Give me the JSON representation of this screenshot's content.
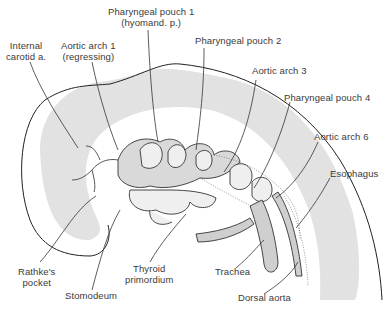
{
  "figure": {
    "labels": {
      "internal_carotid": [
        "Internal",
        "carotid a."
      ],
      "aortic_arch_1": [
        "Aortic arch 1",
        "(regressing)"
      ],
      "pharyngeal_pouch_1": [
        "Pharyngeal pouch 1",
        "(hyomand. p.)"
      ],
      "pharyngeal_pouch_2": [
        "Pharyngeal pouch 2"
      ],
      "aortic_arch_3": [
        "Aortic arch 3"
      ],
      "pharyngeal_pouch_4": [
        "Pharyngeal pouch 4"
      ],
      "aortic_arch_6": [
        "Aortic arch 6"
      ],
      "esophagus": [
        "Esophagus"
      ],
      "rathkes_pocket": [
        "Rathke's",
        "pocket"
      ],
      "stomodeum": [
        "Stomodeum"
      ],
      "thyroid_primordium": [
        "Thyroid",
        "primordium"
      ],
      "trachea": [
        "Trachea"
      ],
      "dorsal_aorta": [
        "Dorsal aorta"
      ]
    },
    "colors": {
      "line": "#333333",
      "shading": "#e2e2e2",
      "text": "#3a3a3a",
      "background": "#ffffff"
    }
  }
}
